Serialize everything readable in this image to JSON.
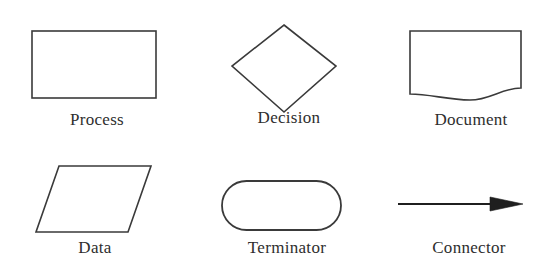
{
  "diagram": {
    "background_color": "#ffffff",
    "stroke_color": "#3a3a3a",
    "label_color": "#2e2e2e",
    "rows": 2,
    "columns": 3,
    "shapes": [
      {
        "id": "process",
        "label": "Process",
        "icon": "rectangle-shape",
        "geometry": "rectangle",
        "row": 1,
        "column": 1
      },
      {
        "id": "decision",
        "label": "Decision",
        "icon": "diamond-shape",
        "geometry": "diamond",
        "row": 1,
        "column": 2
      },
      {
        "id": "document",
        "label": "Document",
        "icon": "document-shape",
        "geometry": "rectangle-with-wavy-bottom",
        "row": 1,
        "column": 3
      },
      {
        "id": "data",
        "label": "Data",
        "icon": "parallelogram-shape",
        "geometry": "parallelogram",
        "row": 2,
        "column": 1
      },
      {
        "id": "terminator",
        "label": "Terminator",
        "icon": "stadium-shape",
        "geometry": "rounded-stadium",
        "row": 2,
        "column": 2
      },
      {
        "id": "connector",
        "label": "Connector",
        "icon": "arrow-right-icon",
        "geometry": "arrow",
        "row": 2,
        "column": 3
      }
    ]
  }
}
